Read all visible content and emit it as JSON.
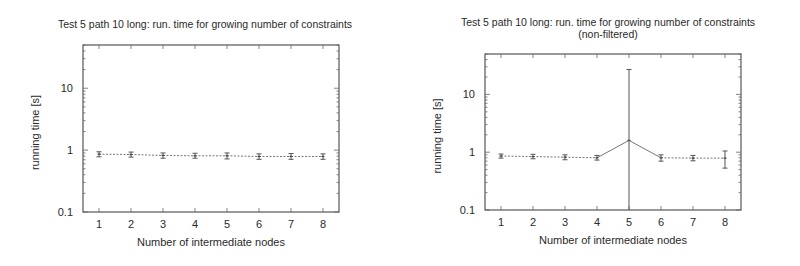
{
  "chart_data": [
    {
      "type": "line",
      "title": "Test 5 path 10 long: run. time for growing number of constraints",
      "subtitle": "",
      "xlabel": "Number of intermediate nodes",
      "ylabel": "running time [s]",
      "yscale": "log",
      "ylim": [
        0.1,
        50
      ],
      "xlim": [
        0.5,
        8.5
      ],
      "x": [
        1,
        2,
        3,
        4,
        5,
        6,
        7,
        8
      ],
      "x_ticks": [
        "1",
        "2",
        "3",
        "4",
        "5",
        "6",
        "7",
        "8"
      ],
      "y_ticks": [
        "0.1",
        "1",
        "10"
      ],
      "grid": false,
      "legend": null,
      "series": [
        {
          "name": "running time",
          "values": [
            0.86,
            0.85,
            0.82,
            0.81,
            0.81,
            0.79,
            0.79,
            0.79
          ],
          "err_low": [
            0.78,
            0.77,
            0.74,
            0.74,
            0.72,
            0.71,
            0.71,
            0.71
          ],
          "err_high": [
            0.94,
            0.93,
            0.9,
            0.89,
            0.9,
            0.87,
            0.88,
            0.87
          ]
        }
      ]
    },
    {
      "type": "line",
      "title": "Test 5 path 10 long: run. time for growing number of constraints",
      "subtitle": "(non-filtered)",
      "xlabel": "Number of intermediate nodes",
      "ylabel": "running time [s]",
      "yscale": "log",
      "ylim": [
        0.1,
        50
      ],
      "xlim": [
        0.5,
        8.5
      ],
      "x": [
        1,
        2,
        3,
        4,
        5,
        6,
        7,
        8
      ],
      "x_ticks": [
        "1",
        "2",
        "3",
        "4",
        "5",
        "6",
        "7",
        "8"
      ],
      "y_ticks": [
        "0.1",
        "1",
        "10"
      ],
      "grid": false,
      "legend": null,
      "series": [
        {
          "name": "running time",
          "values": [
            0.86,
            0.84,
            0.82,
            0.8,
            1.6,
            0.8,
            0.79,
            0.79
          ],
          "err_low": [
            0.79,
            0.77,
            0.74,
            0.73,
            0.1,
            0.7,
            0.71,
            0.53
          ],
          "err_high": [
            0.93,
            0.92,
            0.9,
            0.88,
            27,
            0.9,
            0.88,
            1.05
          ]
        }
      ]
    }
  ]
}
